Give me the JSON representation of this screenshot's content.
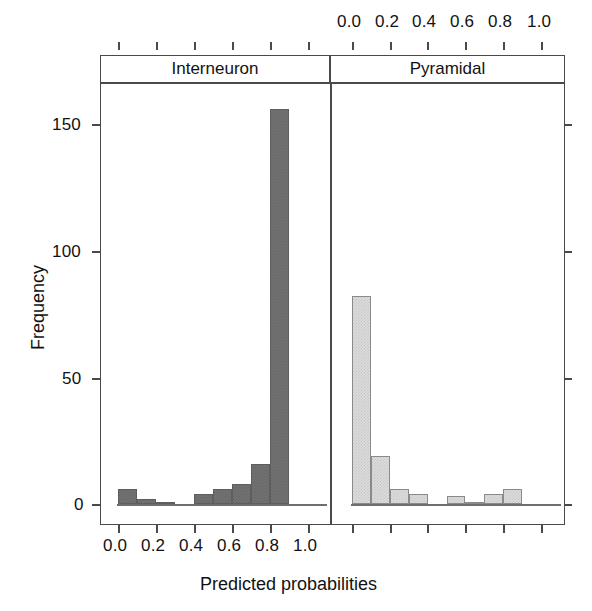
{
  "chart_data": {
    "type": "bar",
    "title": "",
    "xlabel": "Predicted probabilities",
    "ylabel": "Frequency",
    "xlim": [
      -0.05,
      1.08
    ],
    "ylim": [
      0,
      168
    ],
    "grid": false,
    "legend": "none",
    "panel_layout": "1x2 lattice conditioning panels",
    "x_ticks": [
      0.0,
      0.2,
      0.4,
      0.6,
      0.8,
      1.0
    ],
    "x_tick_labels": [
      "0.0",
      "0.2",
      "0.4",
      "0.6",
      "0.8",
      "1.0"
    ],
    "y_ticks": [
      0,
      50,
      100,
      150
    ],
    "y_tick_labels": [
      "0",
      "50",
      "100",
      "150"
    ],
    "bin_width": 0.1,
    "bin_edges": [
      0.0,
      0.1,
      0.2,
      0.3,
      0.4,
      0.5,
      0.6,
      0.7,
      0.8,
      0.9,
      1.0
    ],
    "panels": [
      {
        "name": "Interneuron",
        "strip_label": "Interneuron",
        "axis_position": "bottom",
        "fill_color": "#737373",
        "values": [
          6,
          2,
          1,
          0,
          4,
          6,
          8,
          16,
          156,
          0
        ]
      },
      {
        "name": "Pyramidal",
        "strip_label": "Pyramidal",
        "axis_position": "top",
        "fill_color": "#dcdcdc",
        "values": [
          82,
          19,
          6,
          4,
          0,
          3,
          1,
          4,
          6,
          0
        ]
      }
    ]
  },
  "axes": {
    "x_title": "Predicted probabilities",
    "y_title": "Frequency",
    "x_tick_labels_bottom": [
      "0.0",
      "0.2",
      "0.4",
      "0.6",
      "0.8",
      "1.0"
    ],
    "x_tick_labels_top": [
      "0.0",
      "0.2",
      "0.4",
      "0.6",
      "0.8",
      "1.0"
    ],
    "y_tick_labels": [
      "150",
      "100",
      "50",
      "0"
    ]
  },
  "strips": {
    "left": "Interneuron",
    "right": "Pyramidal"
  },
  "colors": {
    "interneuron_fill": "#737373",
    "pyramidal_fill": "#dcdcdc",
    "frame": "#4a4a4a",
    "text": "#121212",
    "background": "#ffffff"
  }
}
